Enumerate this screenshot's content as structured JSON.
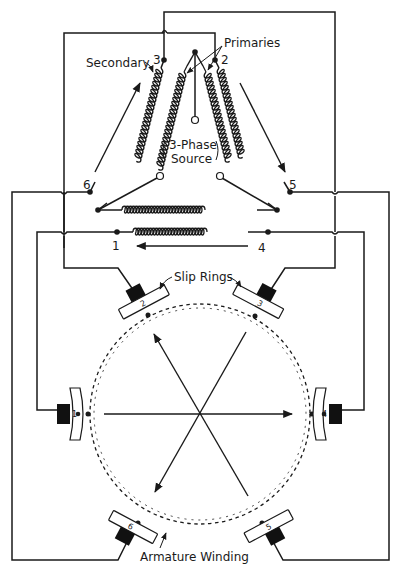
{
  "figure": {
    "labels": {
      "primaries": "Primaries",
      "secondary": "Secondary",
      "source_line1": "3-Phase",
      "source_line2": "Source",
      "slip_rings": "Slip Rings",
      "armature_winding": "Armature Winding"
    },
    "terminals": {
      "t1": "1",
      "t2": "2",
      "t3": "3",
      "t4": "4",
      "t5": "5",
      "t6": "6"
    },
    "slip_ring_numbers": {
      "r1": "1",
      "r2": "2",
      "r3": "3",
      "r4": "4",
      "r5": "5",
      "r6": "6"
    }
  }
}
